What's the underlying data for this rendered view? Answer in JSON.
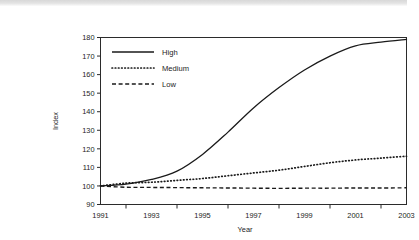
{
  "chart_data": {
    "type": "line",
    "title": "",
    "xlabel": "Year",
    "ylabel": "Index",
    "x": [
      1991,
      1992,
      1993,
      1994,
      1995,
      1996,
      1997,
      1998,
      1999,
      2000,
      2001,
      2002,
      2003
    ],
    "xlim": [
      1991,
      2003
    ],
    "ylim": [
      90,
      180
    ],
    "xticks": [
      1992,
      1994,
      1996,
      1998,
      2000,
      2002
    ],
    "xticklabels": [
      "1991",
      "1993",
      "1995",
      "1997",
      "1999",
      "2001",
      "2003"
    ],
    "xticklabel_values": [
      1991,
      1993,
      1995,
      1997,
      1999,
      2001,
      2003
    ],
    "yticks": [
      90,
      100,
      110,
      120,
      130,
      140,
      150,
      160,
      170,
      180
    ],
    "yticklabels": [
      "90",
      "100",
      "110",
      "120",
      "130",
      "140",
      "150",
      "160",
      "170",
      "180"
    ],
    "grid": false,
    "legend_position": "upper left",
    "series": [
      {
        "name": "High",
        "style": "solid",
        "color": "#1a1a1a",
        "values": [
          100,
          101,
          103.5,
          108,
          117,
          129,
          142,
          153,
          162.5,
          170,
          175.5,
          177.5,
          179
        ]
      },
      {
        "name": "Medium",
        "style": "dotted",
        "color": "#1a1a1a",
        "values": [
          100,
          101.5,
          102,
          103,
          104,
          105.5,
          107,
          108.5,
          110.5,
          112.5,
          114,
          115,
          116
        ]
      },
      {
        "name": "Low",
        "style": "dashed",
        "color": "#1a1a1a",
        "values": [
          100,
          99.3,
          99.2,
          99.1,
          99,
          98.9,
          98.8,
          98.7,
          98.8,
          98.8,
          98.9,
          98.9,
          99
        ]
      }
    ]
  },
  "legend": {
    "items": [
      {
        "label": "High"
      },
      {
        "label": "Medium"
      },
      {
        "label": "Low"
      }
    ]
  },
  "axes": {
    "x_title": "Year",
    "y_title": "Index"
  }
}
